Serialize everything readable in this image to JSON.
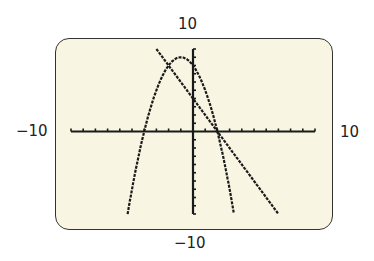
{
  "chart_data": {
    "type": "line",
    "title": "",
    "xlabel": "",
    "ylabel": "",
    "xlim": [
      -10,
      10
    ],
    "ylim": [
      -10,
      10
    ],
    "window_labels": {
      "ymax": "10",
      "ymin": "-10",
      "xmin": "-10",
      "xmax": "10"
    },
    "grid": false,
    "tick_spacing": 1,
    "series": [
      {
        "name": "parabola",
        "equation": "y = -x^2 - 2x + 8",
        "vertex": [
          -1,
          9
        ],
        "x_intercepts": [
          -4,
          2
        ],
        "x_range": [
          -5.36,
          3.36
        ]
      },
      {
        "name": "line",
        "equation": "y = -2x + 4",
        "x_intercept": 2,
        "x_range": [
          -3,
          7
        ]
      }
    ],
    "intersections": [
      [
        -2,
        8
      ],
      [
        2,
        0
      ]
    ]
  },
  "labels": {
    "ymax": "10",
    "ymin": "−10",
    "xmin": "−10",
    "xmax": "10"
  },
  "colors": {
    "screen": "#f8f6e2",
    "ink": "#1a1a1a"
  }
}
